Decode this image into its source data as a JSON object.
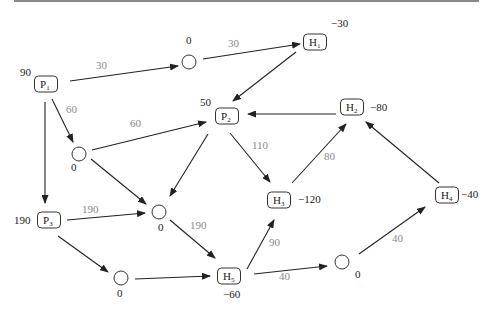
{
  "diagram": {
    "type": "flow-network",
    "nodes": [
      {
        "id": "P1",
        "name": "P",
        "sub": "1",
        "kind": "box",
        "value": "90",
        "x": 46,
        "y": 84,
        "vx": 20,
        "vy": 76
      },
      {
        "id": "P2",
        "name": "P",
        "sub": "2",
        "kind": "box",
        "value": "50",
        "x": 227,
        "y": 116,
        "vx": 200,
        "vy": 106
      },
      {
        "id": "P3",
        "name": "P",
        "sub": "3",
        "kind": "box",
        "value": "190",
        "x": 49,
        "y": 220,
        "vx": 14,
        "vy": 224
      },
      {
        "id": "H1",
        "name": "H",
        "sub": "1",
        "kind": "box",
        "value": "−30",
        "x": 315,
        "y": 42,
        "vx": 331,
        "vy": 27
      },
      {
        "id": "H2",
        "name": "H",
        "sub": "2",
        "kind": "box",
        "value": "−80",
        "x": 352,
        "y": 107,
        "vx": 370,
        "vy": 111
      },
      {
        "id": "H3",
        "name": "H",
        "sub": "3",
        "kind": "box",
        "value": "−120",
        "x": 279,
        "y": 200,
        "vx": 298,
        "vy": 203
      },
      {
        "id": "H4",
        "name": "H",
        "sub": "4",
        "kind": "box",
        "value": "−40",
        "x": 447,
        "y": 195,
        "vx": 461,
        "vy": 198
      },
      {
        "id": "H5",
        "name": "H",
        "sub": "5",
        "kind": "box",
        "value": "−60",
        "x": 229,
        "y": 276,
        "vx": 223,
        "vy": 298
      },
      {
        "id": "T1",
        "kind": "circle",
        "value": "0",
        "x": 189,
        "y": 62,
        "vx": 186,
        "vy": 44
      },
      {
        "id": "T2",
        "kind": "circle",
        "value": "0",
        "x": 79,
        "y": 154,
        "vx": 71,
        "vy": 171
      },
      {
        "id": "T3",
        "kind": "circle",
        "value": "0",
        "x": 159,
        "y": 212,
        "vx": 158,
        "vy": 231
      },
      {
        "id": "T4",
        "kind": "circle",
        "value": "0",
        "x": 121,
        "y": 278,
        "vx": 117,
        "vy": 297
      },
      {
        "id": "T5",
        "kind": "circle",
        "value": "0",
        "x": 342,
        "y": 262,
        "vx": 355,
        "vy": 278
      }
    ],
    "edges": [
      {
        "from": "P1",
        "to": "T1",
        "label": "30",
        "x1": 70,
        "y1": 81,
        "x2": 178,
        "y2": 66,
        "lx": 96,
        "ly": 69
      },
      {
        "from": "T1",
        "to": "H1",
        "label": "30",
        "x1": 203,
        "y1": 59,
        "x2": 300,
        "y2": 44,
        "lx": 228,
        "ly": 47
      },
      {
        "from": "H1",
        "to": "P2",
        "label": "",
        "x1": 296,
        "y1": 52,
        "x2": 233,
        "y2": 101,
        "lx": 0,
        "ly": 0
      },
      {
        "from": "P1",
        "to": "T2",
        "label": "60",
        "x1": 52,
        "y1": 99,
        "x2": 73,
        "y2": 142,
        "lx": 66,
        "ly": 113
      },
      {
        "from": "T2",
        "to": "P2",
        "label": "60",
        "x1": 92,
        "y1": 150,
        "x2": 206,
        "y2": 122,
        "lx": 130,
        "ly": 127
      },
      {
        "from": "P1",
        "to": "P3",
        "label": "",
        "x1": 45,
        "y1": 102,
        "x2": 45,
        "y2": 203,
        "lx": 0,
        "ly": 0
      },
      {
        "from": "H2",
        "to": "P2",
        "label": "",
        "x1": 336,
        "y1": 114,
        "x2": 248,
        "y2": 114,
        "lx": 0,
        "ly": 0
      },
      {
        "from": "P2",
        "to": "H3",
        "label": "110",
        "x1": 230,
        "y1": 133,
        "x2": 270,
        "y2": 182,
        "lx": 252,
        "ly": 149
      },
      {
        "from": "P2",
        "to": "T3",
        "label": "",
        "x1": 208,
        "y1": 134,
        "x2": 170,
        "y2": 196,
        "lx": 0,
        "ly": 0
      },
      {
        "from": "T2",
        "to": "T3",
        "label": "",
        "x1": 91,
        "y1": 159,
        "x2": 146,
        "y2": 204,
        "lx": 0,
        "ly": 0
      },
      {
        "from": "H3",
        "to": "H2",
        "label": "80",
        "x1": 292,
        "y1": 183,
        "x2": 346,
        "y2": 124,
        "lx": 324,
        "ly": 160
      },
      {
        "from": "H4",
        "to": "H2",
        "label": "",
        "x1": 439,
        "y1": 183,
        "x2": 366,
        "y2": 122,
        "lx": 0,
        "ly": 0
      },
      {
        "from": "P3",
        "to": "T3",
        "label": "190",
        "x1": 67,
        "y1": 220,
        "x2": 145,
        "y2": 213,
        "lx": 82,
        "ly": 213
      },
      {
        "from": "T3",
        "to": "H5",
        "label": "190",
        "x1": 170,
        "y1": 220,
        "x2": 215,
        "y2": 258,
        "lx": 190,
        "ly": 229
      },
      {
        "from": "P3",
        "to": "T4",
        "label": "",
        "x1": 58,
        "y1": 236,
        "x2": 108,
        "y2": 272,
        "lx": 0,
        "ly": 0
      },
      {
        "from": "T4",
        "to": "H5",
        "label": "",
        "x1": 135,
        "y1": 279,
        "x2": 210,
        "y2": 276,
        "lx": 0,
        "ly": 0
      },
      {
        "from": "H5",
        "to": "H3",
        "label": "90",
        "x1": 247,
        "y1": 269,
        "x2": 274,
        "y2": 220,
        "lx": 269,
        "ly": 246
      },
      {
        "from": "H5",
        "to": "T5",
        "label": "40",
        "x1": 254,
        "y1": 274,
        "x2": 327,
        "y2": 266,
        "lx": 279,
        "ly": 280
      },
      {
        "from": "T5",
        "to": "H4",
        "label": "40",
        "x1": 359,
        "y1": 254,
        "x2": 425,
        "y2": 207,
        "lx": 392,
        "ly": 242
      }
    ]
  },
  "colors": {
    "stroke": "#222222",
    "edge_label": "#8a8a8a",
    "top_rule": "#8a8a8a"
  }
}
